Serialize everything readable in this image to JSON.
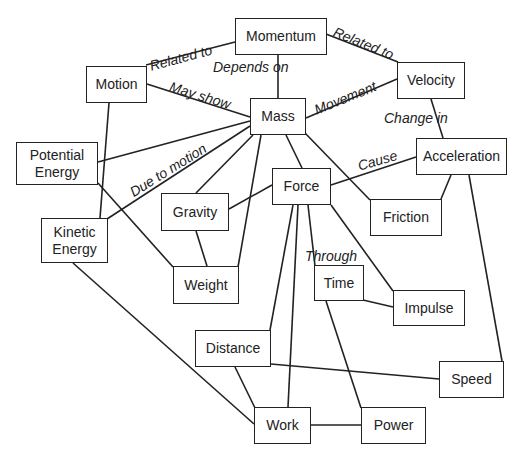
{
  "diagram": {
    "type": "concept-map",
    "nodes": [
      {
        "id": "momentum",
        "label": "Momentum",
        "x": 235,
        "y": 18,
        "w": 92,
        "h": 37
      },
      {
        "id": "motion",
        "label": "Motion",
        "x": 86,
        "y": 66,
        "w": 61,
        "h": 37
      },
      {
        "id": "velocity",
        "label": "Velocity",
        "x": 397,
        "y": 62,
        "w": 68,
        "h": 37
      },
      {
        "id": "mass",
        "label": "Mass",
        "x": 250,
        "y": 98,
        "w": 56,
        "h": 37
      },
      {
        "id": "potential-energy",
        "label": "Potential Energy",
        "x": 16,
        "y": 142,
        "w": 82,
        "h": 43
      },
      {
        "id": "acceleration",
        "label": "Acceleration",
        "x": 416,
        "y": 138,
        "w": 91,
        "h": 37
      },
      {
        "id": "force",
        "label": "Force",
        "x": 272,
        "y": 168,
        "w": 59,
        "h": 37
      },
      {
        "id": "gravity",
        "label": "Gravity",
        "x": 161,
        "y": 193,
        "w": 68,
        "h": 38
      },
      {
        "id": "friction",
        "label": "Friction",
        "x": 370,
        "y": 199,
        "w": 72,
        "h": 37
      },
      {
        "id": "kinetic-energy",
        "label": "Kinetic Energy",
        "x": 41,
        "y": 218,
        "w": 67,
        "h": 45
      },
      {
        "id": "weight",
        "label": "Weight",
        "x": 173,
        "y": 266,
        "w": 66,
        "h": 38
      },
      {
        "id": "time",
        "label": "Time",
        "x": 314,
        "y": 265,
        "w": 50,
        "h": 36
      },
      {
        "id": "impulse",
        "label": "Impulse",
        "x": 393,
        "y": 290,
        "w": 72,
        "h": 36
      },
      {
        "id": "distance",
        "label": "Distance",
        "x": 195,
        "y": 330,
        "w": 76,
        "h": 37
      },
      {
        "id": "speed",
        "label": "Speed",
        "x": 439,
        "y": 361,
        "w": 65,
        "h": 37
      },
      {
        "id": "work",
        "label": "Work",
        "x": 254,
        "y": 407,
        "w": 57,
        "h": 37
      },
      {
        "id": "power",
        "label": "Power",
        "x": 361,
        "y": 407,
        "w": 65,
        "h": 37
      }
    ],
    "edges": [
      {
        "from": "motion",
        "to": "momentum",
        "x1": 146,
        "y1": 65,
        "x2": 235,
        "y2": 42,
        "label": "Related to"
      },
      {
        "from": "momentum",
        "to": "velocity",
        "x1": 326,
        "y1": 34,
        "x2": 398,
        "y2": 62,
        "label": "Related to"
      },
      {
        "from": "momentum",
        "to": "mass",
        "x1": 278,
        "y1": 55,
        "x2": 278,
        "y2": 98,
        "label": "Depends on"
      },
      {
        "from": "motion",
        "to": "mass",
        "x1": 147,
        "y1": 84,
        "x2": 250,
        "y2": 117,
        "label": "May show"
      },
      {
        "from": "mass",
        "to": "velocity",
        "x1": 306,
        "y1": 118,
        "x2": 397,
        "y2": 79,
        "label": "Movement"
      },
      {
        "from": "velocity",
        "to": "acceleration",
        "x1": 431,
        "y1": 99,
        "x2": 443,
        "y2": 138,
        "label": "Change in"
      },
      {
        "from": "motion",
        "to": "kinetic-energy",
        "x1": 109,
        "y1": 103,
        "x2": 100,
        "y2": 218,
        "label": ""
      },
      {
        "from": "potential-energy",
        "to": "mass",
        "x1": 98,
        "y1": 162,
        "x2": 250,
        "y2": 121,
        "label": ""
      },
      {
        "from": "kinetic-energy",
        "to": "mass",
        "x1": 107,
        "y1": 219,
        "x2": 250,
        "y2": 126,
        "label": "Due to motion"
      },
      {
        "from": "potential-energy",
        "to": "weight",
        "x1": 98,
        "y1": 183,
        "x2": 173,
        "y2": 267,
        "label": ""
      },
      {
        "from": "gravity",
        "to": "mass",
        "x1": 196,
        "y1": 193,
        "x2": 253,
        "y2": 135,
        "label": ""
      },
      {
        "from": "weight",
        "to": "mass",
        "x1": 238,
        "y1": 267,
        "x2": 261,
        "y2": 135,
        "label": ""
      },
      {
        "from": "gravity",
        "to": "weight",
        "x1": 196,
        "y1": 231,
        "x2": 207,
        "y2": 266,
        "label": ""
      },
      {
        "from": "mass",
        "to": "force",
        "x1": 286,
        "y1": 135,
        "x2": 302,
        "y2": 168,
        "label": ""
      },
      {
        "from": "mass",
        "to": "friction",
        "x1": 305,
        "y1": 133,
        "x2": 370,
        "y2": 200,
        "label": ""
      },
      {
        "from": "gravity",
        "to": "force",
        "x1": 229,
        "y1": 209,
        "x2": 272,
        "y2": 185,
        "label": ""
      },
      {
        "from": "force",
        "to": "acceleration",
        "x1": 331,
        "y1": 185,
        "x2": 416,
        "y2": 157,
        "label": "Cause"
      },
      {
        "from": "acceleration",
        "to": "friction",
        "x1": 451,
        "y1": 175,
        "x2": 441,
        "y2": 199,
        "label": ""
      },
      {
        "from": "acceleration",
        "to": "speed",
        "x1": 469,
        "y1": 175,
        "x2": 502,
        "y2": 361,
        "label": ""
      },
      {
        "from": "force",
        "to": "distance",
        "x1": 293,
        "y1": 205,
        "x2": 270,
        "y2": 330,
        "label": ""
      },
      {
        "from": "force",
        "to": "work",
        "x1": 298,
        "y1": 205,
        "x2": 288,
        "y2": 407,
        "label": ""
      },
      {
        "from": "force",
        "to": "time",
        "x1": 308,
        "y1": 205,
        "x2": 315,
        "y2": 266,
        "label": "Through"
      },
      {
        "from": "force",
        "to": "impulse",
        "x1": 331,
        "y1": 205,
        "x2": 393,
        "y2": 291,
        "label": ""
      },
      {
        "from": "time",
        "to": "impulse",
        "x1": 363,
        "y1": 300,
        "x2": 393,
        "y2": 307,
        "label": ""
      },
      {
        "from": "time",
        "to": "power",
        "x1": 326,
        "y1": 301,
        "x2": 361,
        "y2": 408,
        "label": ""
      },
      {
        "from": "distance",
        "to": "speed",
        "x1": 271,
        "y1": 364,
        "x2": 439,
        "y2": 379,
        "label": ""
      },
      {
        "from": "distance",
        "to": "work",
        "x1": 235,
        "y1": 367,
        "x2": 255,
        "y2": 408,
        "label": ""
      },
      {
        "from": "kinetic-energy",
        "to": "work",
        "x1": 73,
        "y1": 263,
        "x2": 254,
        "y2": 424,
        "label": ""
      },
      {
        "from": "work",
        "to": "power",
        "x1": 311,
        "y1": 425,
        "x2": 361,
        "y2": 425,
        "label": ""
      }
    ],
    "edge_labels": [
      {
        "text": "Related to",
        "x": 150,
        "y": 66,
        "angle": -15
      },
      {
        "text": "Related to",
        "x": 334,
        "y": 31,
        "angle": 22
      },
      {
        "text": "Depends on",
        "x": 213,
        "y": 67,
        "angle": 0
      },
      {
        "text": "May show",
        "x": 170,
        "y": 86,
        "angle": 17
      },
      {
        "text": "Movement",
        "x": 315,
        "y": 110,
        "angle": -22
      },
      {
        "text": "Change in",
        "x": 384,
        "y": 118,
        "angle": 0
      },
      {
        "text": "Due to motion",
        "x": 131,
        "y": 193,
        "angle": -32
      },
      {
        "text": "Cause",
        "x": 358,
        "y": 166,
        "angle": -16
      },
      {
        "text": "Through",
        "x": 305,
        "y": 256,
        "angle": 0
      }
    ]
  }
}
